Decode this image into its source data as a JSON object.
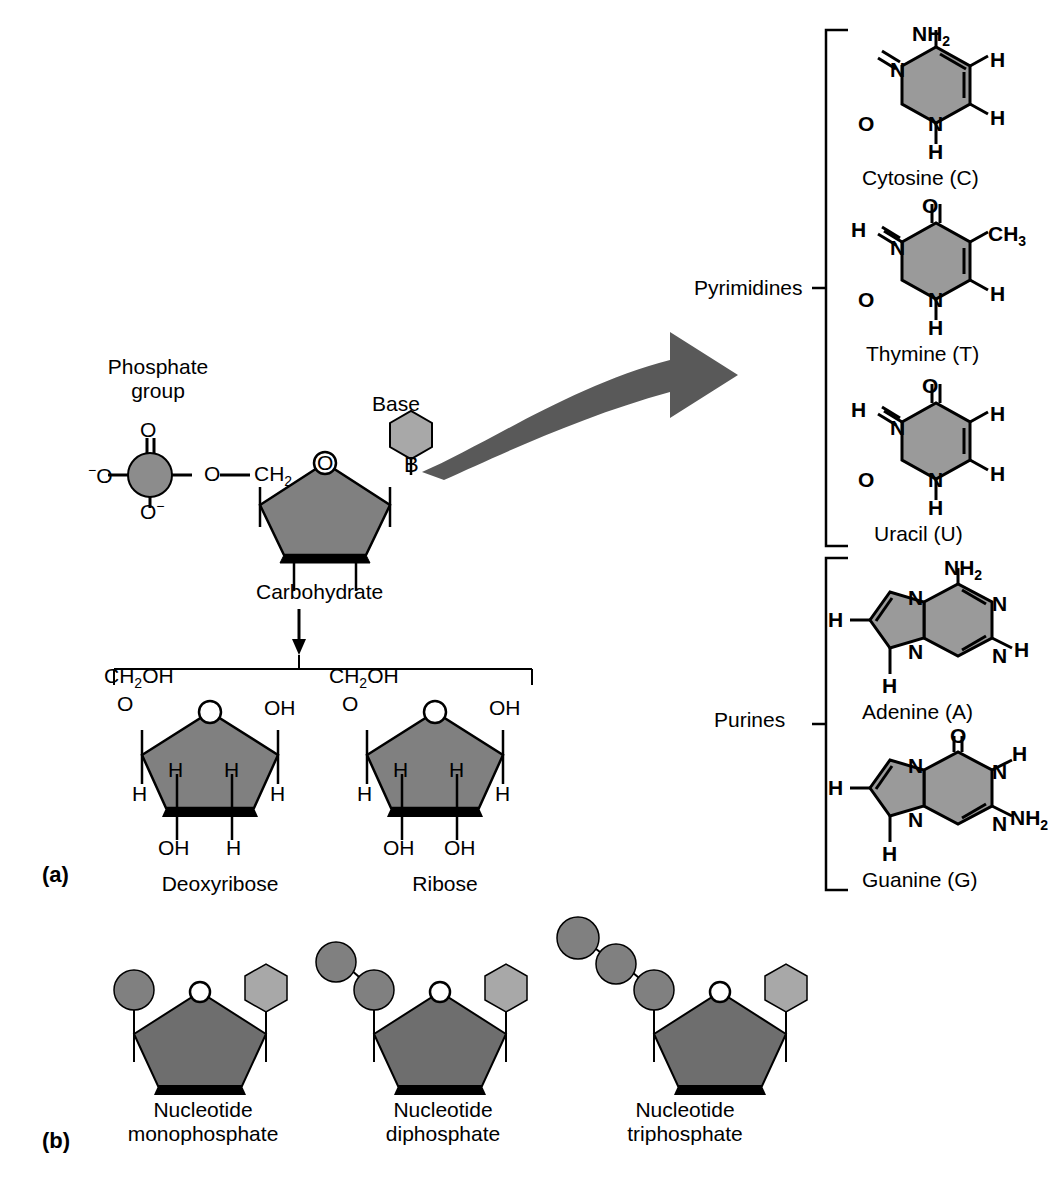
{
  "figure": {
    "type": "diagram",
    "panels": [
      {
        "letter": "(a)",
        "description": "General nucleotide structure with sugars and bases"
      },
      {
        "letter": "(b)",
        "description": "Nucleotide mono-, di- and triphosphates"
      }
    ]
  },
  "panel_a": {
    "letter": "(a)",
    "nucleotide": {
      "phosphate_label": "Phosphate\ngroup",
      "phosphate_label_line1": "Phosphate",
      "phosphate_label_line2": "group",
      "phosphate_center_atom": "P",
      "phosphate_top_oxygen": "O",
      "phosphate_left_oxygen": "O",
      "phosphate_left_charge": "−",
      "phosphate_bottom_oxygen": "O",
      "phosphate_bottom_charge": "−",
      "ester_oxygen": "O",
      "methylene": "CH",
      "methylene_sub": "2",
      "sugar_ring_oxygen": "O",
      "base_label": "Base",
      "base_letter": "B",
      "carbohydrate_label": "Carbohydrate"
    },
    "sugars": [
      {
        "name": "Deoxyribose",
        "top_left_group": "CH",
        "top_left_sub": "2",
        "top_left_rest": "OH",
        "ring_oxygen": "O",
        "top_right_group": "OH",
        "left_bottom": "H",
        "right_bottom": "H",
        "inner_left": "H",
        "inner_right": "H",
        "bottom_left": "OH",
        "bottom_right": "H"
      },
      {
        "name": "Ribose",
        "top_left_group": "CH",
        "top_left_sub": "2",
        "top_left_rest": "OH",
        "ring_oxygen": "O",
        "top_right_group": "OH",
        "left_bottom": "H",
        "right_bottom": "H",
        "inner_left": "H",
        "inner_right": "H",
        "bottom_left": "OH",
        "bottom_right": "OH"
      }
    ]
  },
  "bases": {
    "groups": [
      {
        "group_label": "Pyrimidines",
        "members": [
          {
            "name": "Cytosine (C)",
            "short": "C",
            "ring": "pyrimidine",
            "atoms": {
              "amino_top": "NH",
              "amino_sub": "2",
              "n1": "N",
              "n3": "N",
              "carbonyl_o": "O",
              "h_right_upper": "H",
              "h_right_lower": "H",
              "h_bottom": "H"
            }
          },
          {
            "name": "Thymine (T)",
            "short": "T",
            "ring": "pyrimidine",
            "atoms": {
              "carbonyl_top": "O",
              "h_left": "H",
              "n3": "N",
              "n1": "N",
              "carbonyl_o": "O",
              "methyl": "CH",
              "methyl_sub": "3",
              "h_right": "H",
              "h_bottom": "H"
            }
          },
          {
            "name": "Uracil (U)",
            "short": "U",
            "ring": "pyrimidine",
            "atoms": {
              "carbonyl_top": "O",
              "h_left": "H",
              "n3": "N",
              "n1": "N",
              "carbonyl_o": "O",
              "h_right_upper": "H",
              "h_right_lower": "H",
              "h_bottom": "H"
            }
          }
        ]
      },
      {
        "group_label": "Purines",
        "members": [
          {
            "name": "Adenine (A)",
            "short": "A",
            "ring": "purine",
            "atoms": {
              "amino_top": "NH",
              "amino_sub": "2",
              "n7": "N",
              "n9": "N",
              "n1": "N",
              "n3": "N",
              "h_left": "H",
              "h_right": "H",
              "h_bottom": "H"
            }
          },
          {
            "name": "Guanine (G)",
            "short": "G",
            "ring": "purine",
            "atoms": {
              "carbonyl_o": "O",
              "n7": "N",
              "n9": "N",
              "n1": "N",
              "n3": "N",
              "h_left": "H",
              "h_n1": "H",
              "amino": "NH",
              "amino_sub": "2",
              "h_bottom": "H"
            }
          }
        ]
      }
    ]
  },
  "panel_b": {
    "letter": "(b)",
    "items": [
      {
        "label_line1": "Nucleotide",
        "label_line2": "monophosphate",
        "phosphate_count": 1,
        "ring_oxygen": "O"
      },
      {
        "label_line1": "Nucleotide",
        "label_line2": "diphosphate",
        "phosphate_count": 2,
        "ring_oxygen": "O"
      },
      {
        "label_line1": "Nucleotide",
        "label_line2": "triphosphate",
        "phosphate_count": 3,
        "ring_oxygen": "O"
      }
    ]
  },
  "colors": {
    "background": "#ffffff",
    "line": "#000000",
    "sugar_fill": "#808080",
    "sugar_fill_dark": "#6e6e6e",
    "base_fill": "#a8a8a8",
    "ring_fill": "#9a9a9a",
    "phosphate_fill": "#8c8c8c",
    "arrow_fill": "#595959"
  }
}
